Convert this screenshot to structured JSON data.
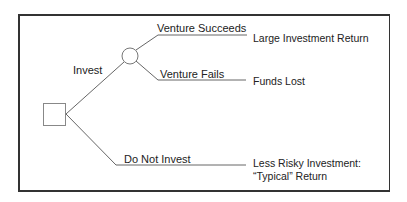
{
  "diagram": {
    "type": "decision-tree",
    "decision_node": {
      "shape": "square"
    },
    "chance_node": {
      "shape": "circle"
    },
    "branches": {
      "invest": {
        "label": "Invest"
      },
      "do_not_invest": {
        "label": "Do Not Invest"
      },
      "venture_succeeds": {
        "label": "Venture Succeeds"
      },
      "venture_fails": {
        "label": "Venture Fails"
      }
    },
    "outcomes": {
      "succeeds": {
        "label": "Large Investment Return"
      },
      "fails": {
        "label": "Funds Lost"
      },
      "not_invest_line1": "Less Risky Investment:",
      "not_invest_line2": "“Typical” Return"
    },
    "colors": {
      "line": "#555555",
      "frame": "#333333",
      "text": "#222222"
    }
  }
}
